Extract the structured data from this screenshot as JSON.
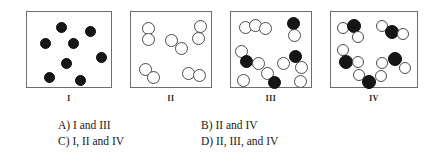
{
  "figure": {
    "caption_labels": [
      "I",
      "II",
      "III",
      "IV"
    ],
    "colors": {
      "dark_particle": "#151515",
      "light_particle": "#ffffff",
      "particle_outline": "#4a4a4a",
      "panel_border": "#6e6e6e",
      "background": "#ffffff",
      "text": "#202020"
    },
    "panels": [
      {
        "label": "I",
        "box": {
          "x": 26,
          "y": 11,
          "w": 86,
          "h": 77
        },
        "description": "eight identical dark spheres, evenly dispersed, no pairing",
        "particles": [
          {
            "kind": "dark",
            "cx": 29,
            "cy": 10,
            "d": 11
          },
          {
            "kind": "dark",
            "cx": 58,
            "cy": 14,
            "d": 11
          },
          {
            "kind": "dark",
            "cx": 13,
            "cy": 26,
            "d": 11
          },
          {
            "kind": "dark",
            "cx": 41,
            "cy": 26,
            "d": 11
          },
          {
            "kind": "dark",
            "cx": 69,
            "cy": 40,
            "d": 11
          },
          {
            "kind": "dark",
            "cx": 34,
            "cy": 46,
            "d": 11
          },
          {
            "kind": "dark",
            "cx": 17,
            "cy": 60,
            "d": 11
          },
          {
            "kind": "dark",
            "cx": 48,
            "cy": 63,
            "d": 11
          }
        ]
      },
      {
        "label": "II",
        "box": {
          "x": 130,
          "y": 11,
          "w": 82,
          "h": 77
        },
        "description": "five diatomic pairs of identical light spheres",
        "particles": [
          {
            "kind": "light",
            "cx": 11,
            "cy": 10,
            "d": 13
          },
          {
            "kind": "light",
            "cx": 11,
            "cy": 21,
            "d": 13
          },
          {
            "kind": "light",
            "cx": 63,
            "cy": 8,
            "d": 13
          },
          {
            "kind": "light",
            "cx": 61,
            "cy": 20,
            "d": 13
          },
          {
            "kind": "light",
            "cx": 34,
            "cy": 22,
            "d": 13
          },
          {
            "kind": "light",
            "cx": 44,
            "cy": 30,
            "d": 13
          },
          {
            "kind": "light",
            "cx": 8,
            "cy": 51,
            "d": 13
          },
          {
            "kind": "light",
            "cx": 16,
            "cy": 59,
            "d": 13
          },
          {
            "kind": "light",
            "cx": 51,
            "cy": 55,
            "d": 13
          },
          {
            "kind": "light",
            "cx": 62,
            "cy": 57,
            "d": 13
          }
        ]
      },
      {
        "label": "III",
        "box": {
          "x": 230,
          "y": 11,
          "w": 82,
          "h": 77
        },
        "description": "mixture of light-sphere groups, dark-light pairs and lone spheres",
        "particles": [
          {
            "kind": "light",
            "cx": 8,
            "cy": 9,
            "d": 13
          },
          {
            "kind": "light",
            "cx": 18,
            "cy": 7,
            "d": 13
          },
          {
            "kind": "light",
            "cx": 28,
            "cy": 10,
            "d": 13
          },
          {
            "kind": "dark",
            "cx": 56,
            "cy": 5,
            "d": 13
          },
          {
            "kind": "light",
            "cx": 57,
            "cy": 17,
            "d": 13
          },
          {
            "kind": "light",
            "cx": 4,
            "cy": 33,
            "d": 13
          },
          {
            "kind": "dark",
            "cx": 9,
            "cy": 43,
            "d": 13
          },
          {
            "kind": "light",
            "cx": 21,
            "cy": 45,
            "d": 13
          },
          {
            "kind": "dark",
            "cx": 58,
            "cy": 38,
            "d": 13
          },
          {
            "kind": "light",
            "cx": 46,
            "cy": 45,
            "d": 13
          },
          {
            "kind": "light",
            "cx": 64,
            "cy": 49,
            "d": 13
          },
          {
            "kind": "light",
            "cx": 30,
            "cy": 55,
            "d": 13
          },
          {
            "kind": "dark",
            "cx": 37,
            "cy": 64,
            "d": 13
          },
          {
            "kind": "light",
            "cx": 6,
            "cy": 62,
            "d": 13
          },
          {
            "kind": "light",
            "cx": 63,
            "cy": 63,
            "d": 13
          }
        ]
      },
      {
        "label": "IV",
        "box": {
          "x": 330,
          "y": 11,
          "w": 88,
          "h": 77
        },
        "description": "five identical triatomic molecules, each one dark sphere bonded to two light spheres",
        "particles": [
          {
            "kind": "light",
            "cx": 6,
            "cy": 10,
            "d": 12
          },
          {
            "kind": "dark",
            "cx": 16,
            "cy": 7,
            "d": 14
          },
          {
            "kind": "light",
            "cx": 21,
            "cy": 19,
            "d": 12
          },
          {
            "kind": "light",
            "cx": 45,
            "cy": 8,
            "d": 12
          },
          {
            "kind": "dark",
            "cx": 54,
            "cy": 13,
            "d": 14
          },
          {
            "kind": "light",
            "cx": 66,
            "cy": 16,
            "d": 12
          },
          {
            "kind": "light",
            "cx": 6,
            "cy": 32,
            "d": 12
          },
          {
            "kind": "dark",
            "cx": 8,
            "cy": 43,
            "d": 14
          },
          {
            "kind": "light",
            "cx": 21,
            "cy": 44,
            "d": 12
          },
          {
            "kind": "dark",
            "cx": 57,
            "cy": 40,
            "d": 14
          },
          {
            "kind": "light",
            "cx": 45,
            "cy": 45,
            "d": 12
          },
          {
            "kind": "light",
            "cx": 68,
            "cy": 50,
            "d": 12
          },
          {
            "kind": "light",
            "cx": 22,
            "cy": 57,
            "d": 12
          },
          {
            "kind": "dark",
            "cx": 31,
            "cy": 63,
            "d": 14
          },
          {
            "kind": "light",
            "cx": 44,
            "cy": 58,
            "d": 12
          }
        ]
      }
    ]
  },
  "options": {
    "a": "A) I and III",
    "b": "B) II and IV",
    "c": "C) I, II and IV",
    "d": "D) II, III, and IV"
  }
}
